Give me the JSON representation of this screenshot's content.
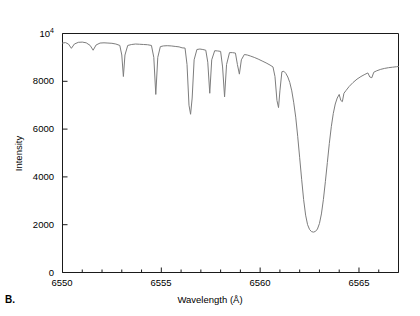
{
  "panel": {
    "label": "B."
  },
  "title": {
    "main": "Solar Atlas",
    "sub": " (after Delbouille et al., 1972, 1981)"
  },
  "axes": {
    "x_title": "Wavelength (Å)",
    "y_title": "Intensity",
    "x_ticks": [
      "6550",
      "6555",
      "6560",
      "6565"
    ],
    "y_ticks": [
      "0",
      "2000",
      "4000",
      "6000",
      "8000"
    ],
    "y_top_mantissa": "10",
    "y_top_exponent": "4"
  },
  "style": {
    "trace_color": "#7d7d7d",
    "axis_color": "#1a1a1a",
    "background": "#ffffff"
  },
  "chart_data": {
    "type": "line",
    "title": "Solar Atlas (after Delbouille et al., 1972, 1981)",
    "xlabel": "Wavelength (Å)",
    "ylabel": "Intensity",
    "xlim": [
      6550,
      6567
    ],
    "ylim": [
      0,
      10000
    ],
    "grid": false,
    "legend": null,
    "x_major_ticks": [
      6550,
      6555,
      6560,
      6565
    ],
    "x_minor_tick_interval": 1,
    "y_major_ticks": [
      0,
      2000,
      4000,
      6000,
      8000,
      10000
    ],
    "series": [
      {
        "name": "Solar spectrum (H-alpha region)",
        "color": "#7d7d7d",
        "continuum_level": 9600,
        "points": [
          [
            6550.0,
            9600
          ],
          [
            6550.15,
            9620
          ],
          [
            6550.3,
            9560
          ],
          [
            6550.45,
            9380
          ],
          [
            6550.6,
            9560
          ],
          [
            6550.8,
            9630
          ],
          [
            6551.0,
            9640
          ],
          [
            6551.2,
            9610
          ],
          [
            6551.4,
            9500
          ],
          [
            6551.55,
            9300
          ],
          [
            6551.7,
            9520
          ],
          [
            6551.9,
            9600
          ],
          [
            6552.1,
            9610
          ],
          [
            6552.3,
            9600
          ],
          [
            6552.5,
            9590
          ],
          [
            6552.7,
            9560
          ],
          [
            6552.9,
            9500
          ],
          [
            6553.0,
            9100
          ],
          [
            6553.08,
            8200
          ],
          [
            6553.16,
            9100
          ],
          [
            6553.3,
            9500
          ],
          [
            6553.5,
            9540
          ],
          [
            6553.7,
            9560
          ],
          [
            6553.9,
            9550
          ],
          [
            6554.1,
            9540
          ],
          [
            6554.3,
            9530
          ],
          [
            6554.5,
            9500
          ],
          [
            6554.62,
            9000
          ],
          [
            6554.72,
            7450
          ],
          [
            6554.82,
            9000
          ],
          [
            6554.95,
            9450
          ],
          [
            6555.1,
            9480
          ],
          [
            6555.3,
            9490
          ],
          [
            6555.5,
            9480
          ],
          [
            6555.7,
            9460
          ],
          [
            6555.9,
            9440
          ],
          [
            6556.05,
            9400
          ],
          [
            6556.2,
            9390
          ],
          [
            6556.3,
            8700
          ],
          [
            6556.4,
            7000
          ],
          [
            6556.48,
            6620
          ],
          [
            6556.56,
            7300
          ],
          [
            6556.66,
            8900
          ],
          [
            6556.8,
            9330
          ],
          [
            6556.95,
            9350
          ],
          [
            6557.1,
            9330
          ],
          [
            6557.25,
            9300
          ],
          [
            6557.35,
            8800
          ],
          [
            6557.45,
            7500
          ],
          [
            6557.55,
            8900
          ],
          [
            6557.7,
            9280
          ],
          [
            6557.85,
            9270
          ],
          [
            6558.0,
            9250
          ],
          [
            6558.1,
            8600
          ],
          [
            6558.2,
            7350
          ],
          [
            6558.3,
            8700
          ],
          [
            6558.45,
            9200
          ],
          [
            6558.6,
            9200
          ],
          [
            6558.75,
            9180
          ],
          [
            6558.85,
            8700
          ],
          [
            6558.95,
            8300
          ],
          [
            6559.05,
            8900
          ],
          [
            6559.2,
            9120
          ],
          [
            6559.35,
            9100
          ],
          [
            6559.5,
            9060
          ],
          [
            6559.7,
            9000
          ],
          [
            6559.9,
            8930
          ],
          [
            6560.1,
            8850
          ],
          [
            6560.3,
            8770
          ],
          [
            6560.5,
            8680
          ],
          [
            6560.65,
            8600
          ],
          [
            6560.75,
            8200
          ],
          [
            6560.85,
            7200
          ],
          [
            6560.93,
            6900
          ],
          [
            6561.0,
            7600
          ],
          [
            6561.1,
            8400
          ],
          [
            6561.2,
            8420
          ],
          [
            6561.3,
            8330
          ],
          [
            6561.4,
            8180
          ],
          [
            6561.5,
            7950
          ],
          [
            6561.6,
            7600
          ],
          [
            6561.7,
            7100
          ],
          [
            6561.8,
            6500
          ],
          [
            6561.9,
            5700
          ],
          [
            6562.0,
            4800
          ],
          [
            6562.1,
            3900
          ],
          [
            6562.2,
            3050
          ],
          [
            6562.3,
            2400
          ],
          [
            6562.4,
            2000
          ],
          [
            6562.5,
            1800
          ],
          [
            6562.6,
            1710
          ],
          [
            6562.7,
            1690
          ],
          [
            6562.8,
            1720
          ],
          [
            6562.9,
            1820
          ],
          [
            6563.0,
            2050
          ],
          [
            6563.1,
            2450
          ],
          [
            6563.2,
            3050
          ],
          [
            6563.3,
            3800
          ],
          [
            6563.4,
            4600
          ],
          [
            6563.5,
            5400
          ],
          [
            6563.6,
            6100
          ],
          [
            6563.7,
            6650
          ],
          [
            6563.8,
            7050
          ],
          [
            6563.9,
            7300
          ],
          [
            6564.0,
            7450
          ],
          [
            6564.08,
            7200
          ],
          [
            6564.16,
            7150
          ],
          [
            6564.24,
            7500
          ],
          [
            6564.35,
            7620
          ],
          [
            6564.5,
            7780
          ],
          [
            6564.7,
            7950
          ],
          [
            6564.9,
            8090
          ],
          [
            6565.1,
            8200
          ],
          [
            6565.3,
            8290
          ],
          [
            6565.45,
            8350
          ],
          [
            6565.55,
            8180
          ],
          [
            6565.65,
            8150
          ],
          [
            6565.75,
            8380
          ],
          [
            6565.9,
            8440
          ],
          [
            6566.1,
            8500
          ],
          [
            6566.3,
            8540
          ],
          [
            6566.5,
            8570
          ],
          [
            6566.7,
            8590
          ],
          [
            6566.9,
            8610
          ],
          [
            6567.0,
            8620
          ]
        ]
      }
    ],
    "annotations": [
      {
        "text": "H-alpha absorption line",
        "x": 6562.7,
        "y": 1690
      }
    ]
  }
}
